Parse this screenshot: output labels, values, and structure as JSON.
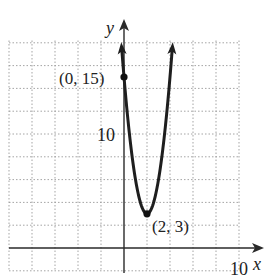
{
  "chart_data": {
    "type": "line",
    "title": "",
    "xlabel": "x",
    "ylabel": "y",
    "function": "y = 3(x - 2)^2 + 3",
    "xlim": [
      -10,
      10
    ],
    "ylim": [
      -2,
      18
    ],
    "grid": true,
    "grid_step": {
      "x": 2,
      "y": 2
    },
    "tick_labels": {
      "x": [
        "10"
      ],
      "y": [
        "10"
      ]
    },
    "series": [
      {
        "name": "parabola",
        "x": [
          -0.2,
          0,
          0.5,
          1,
          1.5,
          2,
          2.5,
          3,
          3.5,
          4,
          4.2
        ],
        "y": [
          17.52,
          15,
          9.75,
          6,
          3.75,
          3,
          3.75,
          6,
          9.75,
          15,
          17.52
        ]
      }
    ],
    "annotations": [
      {
        "label": "(0, 15)",
        "x": 0,
        "y": 15
      },
      {
        "label": "(2, 3)",
        "x": 2,
        "y": 3
      }
    ]
  },
  "labels": {
    "x_axis": "x",
    "y_axis": "y",
    "x_tick": "10",
    "y_tick": "10",
    "point_intercept": "(0, 15)",
    "point_vertex": "(2, 3)"
  }
}
